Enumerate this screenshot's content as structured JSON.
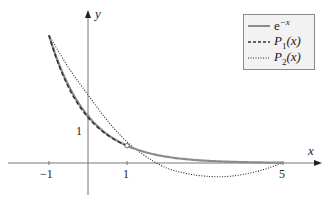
{
  "chart_data": {
    "type": "line",
    "title": "",
    "xlabel": "x",
    "ylabel": "y",
    "xlim": [
      -1.9,
      6.0
    ],
    "ylim": [
      -0.8,
      3.5
    ],
    "grid": false,
    "legend_position": "upper right",
    "x_ticks": [
      {
        "value": -1,
        "label": "−1"
      },
      {
        "value": 1,
        "label": "1"
      },
      {
        "value": 5,
        "label": "5"
      }
    ],
    "y_ticks": [
      {
        "value": 1,
        "label": "1"
      }
    ],
    "series": [
      {
        "name": "e^{-x}",
        "legend_label": "e",
        "legend_sup": "−x",
        "style": "solid",
        "color": "#8c8c8c",
        "x": [
          -1,
          -0.5,
          0,
          0.5,
          1,
          1.5,
          2,
          2.5,
          3,
          3.5,
          4,
          4.5,
          5
        ],
        "values": [
          2.718,
          1.649,
          1.0,
          0.607,
          0.368,
          0.223,
          0.135,
          0.082,
          0.05,
          0.03,
          0.018,
          0.011,
          0.007
        ]
      },
      {
        "name": "P1(x)",
        "legend_label": "P",
        "legend_sub": "1",
        "legend_suffix": "(x)",
        "style": "dashed",
        "color": "#333333",
        "x": [
          -1,
          -0.5,
          0,
          0.5,
          1
        ],
        "values": [
          2.718,
          1.66,
          0.98,
          0.62,
          0.368
        ]
      },
      {
        "name": "P2(x)",
        "legend_label": "P",
        "legend_sub": "2",
        "legend_suffix": "(x)",
        "style": "dotted",
        "color": "#222222",
        "x": [
          -1,
          -0.5,
          0,
          0.5,
          1,
          1.5,
          2,
          2.5,
          3,
          3.5,
          4,
          4.5,
          5
        ],
        "values": [
          2.718,
          2.03,
          1.45,
          0.9,
          0.45,
          0.13,
          -0.1,
          -0.22,
          -0.28,
          -0.29,
          -0.24,
          -0.14,
          0.007
        ]
      }
    ],
    "markers": [
      {
        "x": 1,
        "y": 0.368,
        "shape": "open-circle"
      }
    ]
  },
  "axes": {
    "x_label": "x",
    "y_label": "y"
  }
}
